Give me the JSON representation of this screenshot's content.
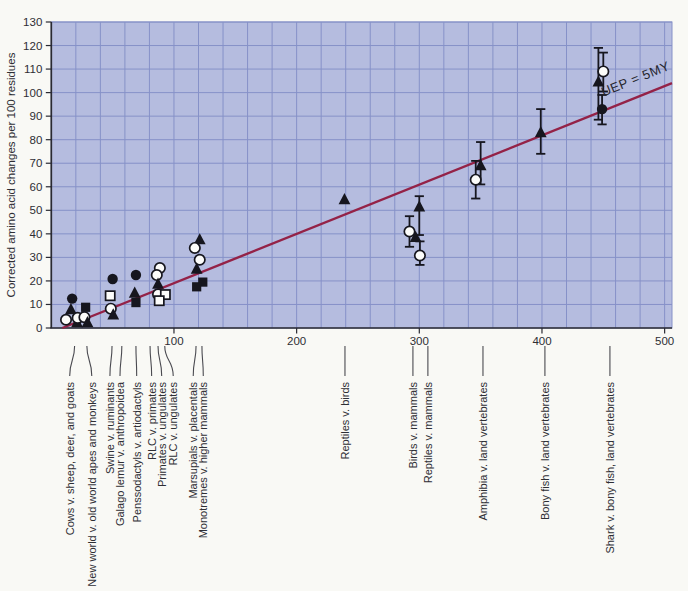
{
  "colors": {
    "page_bg": "#f9f9f5",
    "plot_bg": "#b5bcdf",
    "grid_line": "#8691c8",
    "trend_line": "#942247",
    "marker": "#16161e",
    "marker_open_fill": "#fcfcfa",
    "axis": "#2a2a32",
    "text": "#2e2e34",
    "connector": "#4a4a50"
  },
  "chart_data": {
    "type": "scatter",
    "title": "",
    "xlabel": "",
    "ylabel": "Corrected amino acid changes per 100 residues",
    "xlim": [
      0,
      506
    ],
    "ylim": [
      0,
      130
    ],
    "x_ticks": [
      100,
      200,
      300,
      400,
      500
    ],
    "y_ticks": [
      0,
      10,
      20,
      30,
      40,
      50,
      60,
      70,
      80,
      90,
      100,
      110,
      120,
      130
    ],
    "grid": {
      "x_step": 20,
      "y_step": 10,
      "visible": true
    },
    "trend_line": {
      "label": "UEP = 5MY",
      "x1": 9,
      "y1": 0,
      "x2": 506,
      "y2": 104
    },
    "points": [
      {
        "x": 17,
        "y": 12.5,
        "symbol": "circle-filled"
      },
      {
        "x": 16,
        "y": 7.8,
        "symbol": "triangle-filled"
      },
      {
        "x": 12,
        "y": 3.5,
        "symbol": "circle-open"
      },
      {
        "x": 21,
        "y": 2.3,
        "symbol": "triangle-filled"
      },
      {
        "x": 21.5,
        "y": 4.3,
        "symbol": "circle-open"
      },
      {
        "x": 28,
        "y": 8.8,
        "symbol": "square-filled"
      },
      {
        "x": 27,
        "y": 4.6,
        "symbol": "circle-open"
      },
      {
        "x": 29.5,
        "y": 2.3,
        "symbol": "triangle-filled"
      },
      {
        "x": 50,
        "y": 20.8,
        "symbol": "circle-filled"
      },
      {
        "x": 48,
        "y": 13.7,
        "symbol": "square-open"
      },
      {
        "x": 48.5,
        "y": 8.2,
        "symbol": "circle-open"
      },
      {
        "x": 50.5,
        "y": 5.6,
        "symbol": "triangle-filled"
      },
      {
        "x": 69,
        "y": 22.5,
        "symbol": "circle-filled"
      },
      {
        "x": 68,
        "y": 14.8,
        "symbol": "triangle-filled"
      },
      {
        "x": 69,
        "y": 10.8,
        "symbol": "square-filled"
      },
      {
        "x": 88.5,
        "y": 25.5,
        "symbol": "circle-open"
      },
      {
        "x": 86,
        "y": 22.5,
        "symbol": "circle-open"
      },
      {
        "x": 87,
        "y": 18.6,
        "symbol": "triangle-filled"
      },
      {
        "x": 87,
        "y": 14.3,
        "symbol": "circle-open"
      },
      {
        "x": 93,
        "y": 14.2,
        "symbol": "square-open"
      },
      {
        "x": 88,
        "y": 11.6,
        "symbol": "square-open"
      },
      {
        "x": 121,
        "y": 37.5,
        "symbol": "triangle-filled"
      },
      {
        "x": 117,
        "y": 34,
        "symbol": "circle-open"
      },
      {
        "x": 121,
        "y": 29,
        "symbol": "circle-open"
      },
      {
        "x": 118.5,
        "y": 25,
        "symbol": "triangle-filled"
      },
      {
        "x": 123.5,
        "y": 19.5,
        "symbol": "square-filled"
      },
      {
        "x": 118.5,
        "y": 17.5,
        "symbol": "square-filled"
      },
      {
        "x": 239,
        "y": 54.5,
        "symbol": "triangle-filled"
      },
      {
        "x": 300,
        "y": 51.5,
        "symbol": "triangle-filled",
        "err": [
          39.5,
          56
        ]
      },
      {
        "x": 292,
        "y": 41,
        "symbol": "circle-open",
        "err": [
          34.5,
          47.5
        ]
      },
      {
        "x": 297,
        "y": 38.5,
        "symbol": "triangle-filled"
      },
      {
        "x": 300.5,
        "y": 30.8,
        "symbol": "circle-open",
        "err": [
          26.8,
          36.8
        ]
      },
      {
        "x": 350,
        "y": 69,
        "symbol": "triangle-filled",
        "err": [
          61,
          79
        ]
      },
      {
        "x": 346,
        "y": 63,
        "symbol": "circle-open",
        "err": [
          55,
          71
        ]
      },
      {
        "x": 399,
        "y": 83,
        "symbol": "triangle-filled",
        "err": [
          74,
          93
        ]
      },
      {
        "x": 446,
        "y": 104.5,
        "symbol": "triangle-filled",
        "err": [
          88.5,
          119
        ]
      },
      {
        "x": 450,
        "y": 109,
        "symbol": "circle-open",
        "err": [
          100.5,
          117
        ]
      },
      {
        "x": 449,
        "y": 93,
        "symbol": "circle-filled",
        "err": [
          86.5,
          99
        ]
      }
    ],
    "comparisons_left": [
      {
        "label": "Cows v. sheep, deer, and goats",
        "anchor_x": 19,
        "label_x": 15
      },
      {
        "label": "New world v. old world apes and monkeys",
        "anchor_x": 29,
        "label_x": 33
      },
      {
        "label": "Swine v. ruminants",
        "anchor_x": 49.5,
        "label_x": 47.8
      },
      {
        "label": "Galago lemur v. anthropoidea",
        "anchor_x": 57.5,
        "label_x": 56
      },
      {
        "label": "Penssodactyls v. artiodactyls",
        "anchor_x": 69,
        "label_x": 69.6
      },
      {
        "label": "RLC v. primates",
        "anchor_x": 80.5,
        "label_x": 81.8
      },
      {
        "label": "Primates v. ungulates",
        "anchor_x": 87,
        "label_x": 90
      },
      {
        "label": "RLC v. ungulates",
        "anchor_x": 92.5,
        "label_x": 99.4
      },
      {
        "label": "Marsupials v. placentals",
        "anchor_x": 118,
        "label_x": 115.7
      },
      {
        "label": "Monotremes v. higher mammals",
        "anchor_x": 122.8,
        "label_x": 123.9
      }
    ],
    "comparisons_right": [
      {
        "label": "Reptiles v. birds",
        "x": 239.4
      },
      {
        "label": "Birds v. mammals",
        "x": 294.8
      },
      {
        "label": "Reptiles v. mammals",
        "x": 307
      },
      {
        "label": "Amphibia v. land vertebrates",
        "x": 351.9
      },
      {
        "label": "Bony fish v. land vertebrates",
        "x": 402.4
      },
      {
        "label": "Shark v. bony fish, land vertebrates",
        "x": 455.4
      }
    ]
  }
}
